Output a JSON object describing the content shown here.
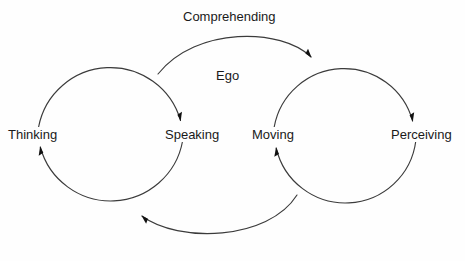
{
  "diagram": {
    "title_label": "Ego",
    "background_color": "#fefefe",
    "stroke_color": "#3b3b3b",
    "text_color": "#1a1a1a",
    "nodes": [
      {
        "id": "thinking",
        "label": "Thinking",
        "x": 38,
        "y": 134
      },
      {
        "id": "speaking",
        "label": "Speaking",
        "x": 183,
        "y": 134
      },
      {
        "id": "moving",
        "label": "Moving",
        "x": 274,
        "y": 134
      },
      {
        "id": "perceiving",
        "label": "Perceiving",
        "x": 416,
        "y": 134
      }
    ],
    "edge_labels": [
      {
        "id": "comprehending",
        "label": "Comprehending",
        "x": 233,
        "y": 17
      }
    ],
    "center_labels": [
      {
        "id": "ego",
        "label": "Ego",
        "x": 228,
        "y": 76
      }
    ],
    "cycles": [
      {
        "id": "left-cycle",
        "cx": 110,
        "cy": 134,
        "r": 73,
        "direction": "clockwise"
      },
      {
        "id": "right-cycle",
        "cx": 345,
        "cy": 134,
        "r": 71,
        "direction": "clockwise"
      }
    ],
    "connectors": [
      {
        "id": "comprehending-arc",
        "from": "speaking",
        "to": "moving",
        "position": "top"
      },
      {
        "id": "return-arc",
        "from": "perceiving",
        "to": "thinking",
        "position": "bottom"
      }
    ]
  }
}
